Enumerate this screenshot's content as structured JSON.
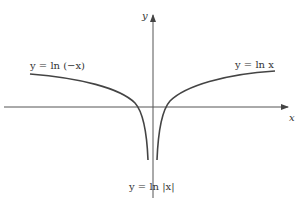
{
  "axes": {
    "x_label": "x",
    "y_label": "y"
  },
  "curves": {
    "left_label": "y = ln (−x)",
    "right_label": "y = ln x",
    "bottom_label": "y = ln |x|"
  },
  "colors": {
    "curve": "#444444",
    "axis": "#555555"
  }
}
